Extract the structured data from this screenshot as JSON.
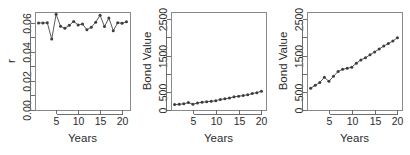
{
  "figure": {
    "background": "#ffffff",
    "point_color": "#3d3d3d",
    "line_color": "#5a5a5a",
    "axis_color": "#6e6e6e",
    "panel_count": 3
  },
  "chart_data": [
    {
      "type": "line",
      "panel_index": 0,
      "title": "",
      "xlabel": "Years",
      "ylabel": "r",
      "xlim": [
        0.2,
        21.8
      ],
      "ylim": [
        0.0,
        0.0675
      ],
      "grid": false,
      "legend": "none",
      "xticks": [
        5,
        10,
        15,
        20
      ],
      "xtick_labels": [
        "5",
        "10",
        "15",
        "20"
      ],
      "yticks": [
        0.0,
        0.01,
        0.02,
        0.03,
        0.04,
        0.05,
        0.06
      ],
      "ytick_labels": [
        "0.00",
        "",
        "0.02",
        "",
        "0.04",
        "",
        "0.06"
      ],
      "x": [
        1,
        2,
        3,
        4,
        5,
        6,
        7,
        8,
        9,
        10,
        11,
        12,
        13,
        14,
        15,
        16,
        17,
        18,
        19,
        20,
        21
      ],
      "values": [
        0.06,
        0.0599,
        0.0601,
        0.0489,
        0.0659,
        0.0577,
        0.0563,
        0.0583,
        0.061,
        0.0586,
        0.0592,
        0.0553,
        0.057,
        0.0604,
        0.0653,
        0.0575,
        0.0634,
        0.0546,
        0.0601,
        0.0598,
        0.0607
      ]
    },
    {
      "type": "line",
      "panel_index": 1,
      "title": "",
      "xlabel": "Years",
      "ylabel": "Bond Value",
      "xlim": [
        0.2,
        21.0
      ],
      "ylim": [
        0,
        2700
      ],
      "grid": false,
      "legend": "none",
      "xticks": [
        5,
        10,
        15,
        20
      ],
      "xtick_labels": [
        "5",
        "10",
        "15",
        "20"
      ],
      "yticks": [
        0,
        500,
        1000,
        1500,
        2000,
        2500
      ],
      "ytick_labels": [
        "0",
        "500",
        "",
        "1500",
        "",
        "2500"
      ],
      "x": [
        1,
        2,
        3,
        4,
        5,
        6,
        7,
        8,
        9,
        10,
        11,
        12,
        13,
        14,
        15,
        16,
        17,
        18,
        19,
        20
      ],
      "values": [
        150,
        158,
        170,
        205,
        160,
        195,
        215,
        228,
        240,
        258,
        288,
        310,
        328,
        362,
        378,
        400,
        418,
        452,
        478,
        520
      ]
    },
    {
      "type": "line",
      "panel_index": 2,
      "title": "",
      "xlabel": "Years",
      "ylabel": "Bond Value",
      "xlim": [
        0.2,
        21.0
      ],
      "ylim": [
        0,
        2700
      ],
      "grid": false,
      "legend": "none",
      "xticks": [
        5,
        10,
        15,
        20
      ],
      "xtick_labels": [
        "5",
        "10",
        "15",
        "20"
      ],
      "yticks": [
        0,
        500,
        1000,
        1500,
        2000,
        2500
      ],
      "ytick_labels": [
        "0",
        "500",
        "",
        "1500",
        "",
        "2500"
      ],
      "x": [
        1,
        2,
        3,
        4,
        5,
        6,
        7,
        8,
        9,
        10,
        11,
        12,
        13,
        14,
        15,
        16,
        17,
        18,
        19,
        20
      ],
      "values": [
        600,
        680,
        760,
        900,
        790,
        930,
        1060,
        1120,
        1150,
        1180,
        1290,
        1380,
        1440,
        1520,
        1600,
        1680,
        1760,
        1830,
        1900,
        1990
      ]
    }
  ]
}
